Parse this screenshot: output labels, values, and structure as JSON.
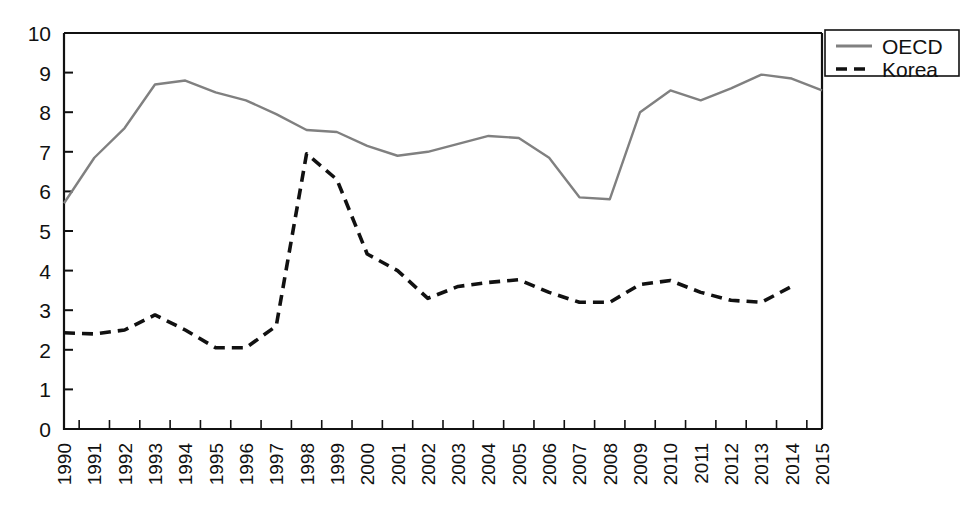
{
  "chart_data": {
    "type": "line",
    "title": "",
    "subtitle": "",
    "xlabel": "",
    "ylabel": "",
    "xlim": [
      1990,
      2015
    ],
    "ylim": [
      0,
      10
    ],
    "grid": false,
    "legend_position": "top-right",
    "x": [
      1990,
      1991,
      1992,
      1993,
      1994,
      1995,
      1996,
      1997,
      1998,
      1999,
      2000,
      2001,
      2002,
      2003,
      2004,
      2005,
      2006,
      2007,
      2008,
      2009,
      2010,
      2011,
      2012,
      2013,
      2014,
      2015
    ],
    "xtick_labels": [
      "1990",
      "1991",
      "1992",
      "1993",
      "1994",
      "1995",
      "1996",
      "1997",
      "1998",
      "1999",
      "2000",
      "2001",
      "2002",
      "2003",
      "2004",
      "2005",
      "2006",
      "2007",
      "2008",
      "2009",
      "2010",
      "2011",
      "2012",
      "2013",
      "2014",
      "2015"
    ],
    "ytick_labels": [
      "0",
      "1",
      "2",
      "3",
      "4",
      "5",
      "6",
      "7",
      "8",
      "9",
      "10"
    ],
    "yticks": [
      0,
      1,
      2,
      3,
      4,
      5,
      6,
      7,
      8,
      9,
      10
    ],
    "series": [
      {
        "name": "OECD",
        "style": "solid",
        "color": "#808080",
        "values": [
          5.7,
          6.85,
          7.6,
          8.7,
          8.8,
          8.5,
          8.3,
          7.95,
          7.55,
          7.5,
          7.15,
          6.9,
          7.0,
          7.2,
          7.4,
          7.35,
          6.85,
          5.85,
          5.8,
          8.0,
          8.55,
          8.3,
          8.6,
          8.95,
          8.85,
          8.55
        ]
      },
      {
        "name": "Korea",
        "style": "dashed",
        "color": "#111111",
        "values": [
          2.43,
          2.4,
          2.5,
          2.88,
          2.5,
          2.05,
          2.05,
          2.6,
          6.95,
          6.3,
          4.42,
          4.0,
          3.3,
          3.6,
          3.7,
          3.77,
          3.45,
          3.2,
          3.2,
          3.65,
          3.75,
          3.45,
          3.25,
          3.2,
          3.6,
          null
        ]
      }
    ]
  },
  "legend": {
    "items": [
      {
        "label": "OECD",
        "style": "solid",
        "color": "#808080"
      },
      {
        "label": "Korea",
        "style": "dashed",
        "color": "#111111"
      }
    ]
  },
  "axes": {
    "y_min": 0,
    "y_max": 10,
    "axis_color": "#111111"
  }
}
